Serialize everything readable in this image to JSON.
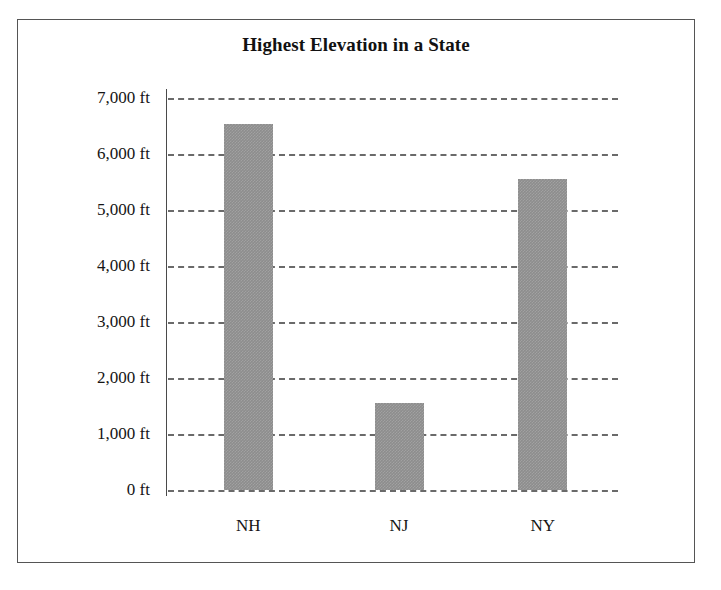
{
  "chart_data": {
    "type": "bar",
    "title": "Highest Elevation in a State",
    "xlabel": "",
    "ylabel": "",
    "categories": [
      "NH",
      "NJ",
      "NY"
    ],
    "values": [
      6530,
      1560,
      5550
    ],
    "unit": "ft",
    "ylim": [
      0,
      7000
    ],
    "ytick_values": [
      7000,
      6000,
      5000,
      4000,
      3000,
      2000,
      1000,
      0
    ],
    "ytick_labels": [
      "7,000 ft",
      "6,000 ft",
      "5,000 ft",
      "4,000 ft",
      "3,000 ft",
      "2,000 ft",
      "1,000 ft",
      "0 ft"
    ],
    "grid": true,
    "grid_style": "dashed-horizontal",
    "legend": false,
    "legend_position": "none",
    "bar_color": "#8d8d8d",
    "grid_color": "#6a6a6a",
    "axis_color": "#4a4a4a",
    "frame_color": "#555555",
    "background_color": "#ffffff",
    "text_color": "#151515"
  }
}
